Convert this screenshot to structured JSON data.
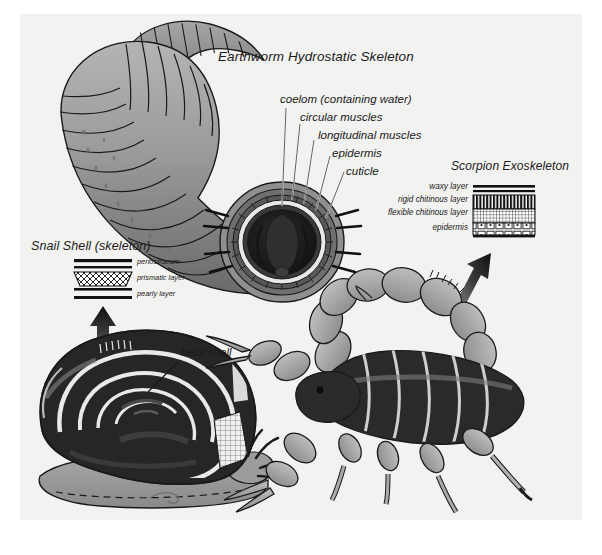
{
  "figure": {
    "background_color": "#f2f2f0",
    "page_color": "#ffffff",
    "ink_color": "#1a1a1a"
  },
  "panels": {
    "earthworm": {
      "title": "Earthworm Hydrostatic Skeleton",
      "labels": [
        "coelom (containing water)",
        "circular muscles",
        "longitudinal muscles",
        "epidermis",
        "cuticle"
      ]
    },
    "scorpion": {
      "title": "Scorpion Exoskeleton",
      "layers": [
        "waxy layer",
        "rigid chitinous layer",
        "flexible chitinous layer",
        "epidermis"
      ]
    },
    "snail": {
      "title": "Snail Shell (skeleton)",
      "layers": [
        "periostracum",
        "prismatic layer",
        "pearly layer"
      ],
      "callout": "helix shell"
    }
  },
  "colors": {
    "worm_light": "#a8a8a8",
    "worm_mid": "#8d8d8d",
    "worm_dark": "#6e6e6e",
    "worm_darker": "#565656",
    "core_dark": "#1c1c1c",
    "shell_dark": "#262626",
    "body_gray": "#9a9a9a",
    "scorpion_leg": "#a9a9a9",
    "scorpion_body": "#2a2a2a",
    "outline": "#1a1a1a",
    "white": "#ffffff"
  }
}
